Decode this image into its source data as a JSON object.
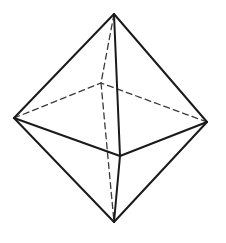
{
  "diagram": {
    "colors": {
      "background": "#ffffff",
      "edge": "#1a1a1a",
      "hidden_edge": "#3a3a3a"
    },
    "vertices": {
      "top": [
        114,
        14
      ],
      "left": [
        14,
        118
      ],
      "right": [
        207,
        122
      ],
      "front": [
        120,
        156
      ],
      "back": [
        101,
        83
      ],
      "bottom": [
        114,
        222
      ]
    },
    "visible_edges": [
      [
        "top",
        "left"
      ],
      [
        "top",
        "right"
      ],
      [
        "top",
        "front"
      ],
      [
        "left",
        "front"
      ],
      [
        "right",
        "front"
      ],
      [
        "left",
        "bottom"
      ],
      [
        "right",
        "bottom"
      ],
      [
        "front",
        "bottom"
      ]
    ],
    "hidden_edges": [
      [
        "top",
        "back"
      ],
      [
        "left",
        "back"
      ],
      [
        "right",
        "back"
      ],
      [
        "back",
        "bottom"
      ]
    ]
  }
}
